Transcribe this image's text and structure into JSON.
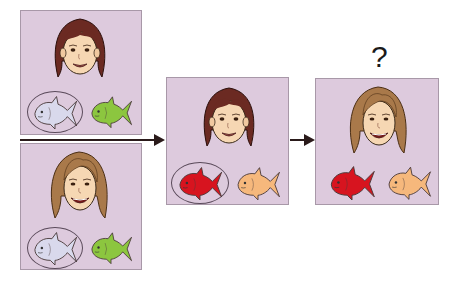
{
  "figure": {
    "question_label": "?",
    "colors": {
      "panel_bg": "#ddcadd",
      "panel_border": "#a898a8",
      "arrow": "#2a1a1a",
      "fish_grey": "#d9d9ec",
      "fish_green": "#8cc63f",
      "fish_red": "#d7141f",
      "fish_peach": "#f6b87c",
      "hair_dark": "#6b2a22",
      "hair_light": "#a9794a",
      "skin": "#f6d7b3"
    },
    "panels": [
      {
        "id": "panel-top-left",
        "face": "dark-haired girl",
        "fish": [
          {
            "color": "grey",
            "circled": true
          },
          {
            "color": "green",
            "circled": false
          }
        ]
      },
      {
        "id": "panel-bottom-left",
        "face": "light-brown-haired woman",
        "fish": [
          {
            "color": "grey",
            "circled": true
          },
          {
            "color": "green",
            "circled": false
          }
        ]
      },
      {
        "id": "panel-middle",
        "face": "dark-haired girl",
        "fish": [
          {
            "color": "red",
            "circled": true
          },
          {
            "color": "peach",
            "circled": false
          }
        ]
      },
      {
        "id": "panel-right",
        "face": "light-brown-haired woman",
        "fish": [
          {
            "color": "red",
            "circled": false
          },
          {
            "color": "peach",
            "circled": false
          }
        ]
      }
    ]
  }
}
